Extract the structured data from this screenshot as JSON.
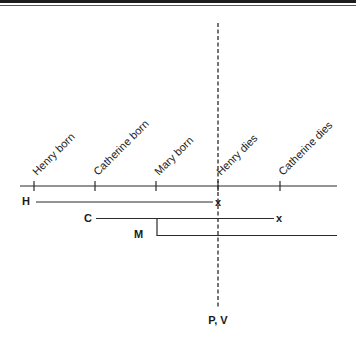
{
  "diagram": {
    "type": "timeline",
    "events": [
      {
        "id": "henry-born",
        "label": "Henry born"
      },
      {
        "id": "catherine-born",
        "label": "Catherine born"
      },
      {
        "id": "mary-born",
        "label": "Mary born"
      },
      {
        "id": "henry-dies",
        "label": "Henry dies"
      },
      {
        "id": "catherine-dies",
        "label": "Catherine dies"
      }
    ],
    "lifelines": [
      {
        "id": "H",
        "label": "H",
        "start_event": "henry-born",
        "end_event": "henry-dies",
        "end_mark": "x"
      },
      {
        "id": "C",
        "label": "C",
        "start_event": "catherine-born",
        "end_event": "catherine-dies",
        "end_mark": "x"
      },
      {
        "id": "M",
        "label": "M",
        "start_event": "mary-born",
        "end_event": null,
        "end_mark": "",
        "branches_from": "C"
      }
    ],
    "reference_line": {
      "at_event": "henry-dies",
      "label": "P, V"
    }
  }
}
